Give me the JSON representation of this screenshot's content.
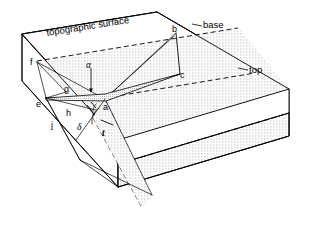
{
  "figure": {
    "background_color": "#ffffff",
    "line_color": "#000000"
  },
  "annotations": {
    "topographic_surface": "topographic surface",
    "base": "base",
    "top": "top"
  },
  "point_labels": {
    "a": "a",
    "b": "b",
    "c": "c",
    "e": "e",
    "f": "f",
    "g": "g",
    "h": "h",
    "j": "j",
    "t": "t"
  },
  "greek_labels": {
    "alpha": "α",
    "delta": "δ"
  },
  "geometry": {
    "block_corners": {
      "top_back_left": [
        22,
        34
      ],
      "top_back_right": [
        157,
        12
      ],
      "top_front_right": [
        289,
        89
      ],
      "top_front_left": [
        118,
        140
      ],
      "bottom_front_left": [
        118,
        187
      ],
      "bottom_front_right": [
        289,
        136
      ],
      "left_lower": [
        22,
        81
      ]
    },
    "layer_points": {
      "a": [
        105,
        99
      ],
      "b": [
        176,
        33
      ],
      "c": [
        180,
        74
      ],
      "e": [
        46,
        98
      ],
      "f": [
        37,
        62
      ],
      "g": [
        63,
        88
      ]
    },
    "stipple": {
      "dot_spacing": 3,
      "dot_radius": 0.42,
      "dot_color": "#1a1a1a"
    },
    "grey_band": {
      "dot_spacing": 2,
      "dot_color": "#555555"
    }
  }
}
